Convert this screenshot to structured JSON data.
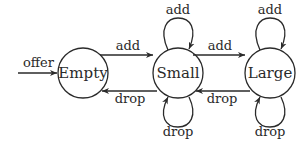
{
  "diagram": {
    "type": "state-machine",
    "states": [
      {
        "id": "empty",
        "label": "Empty"
      },
      {
        "id": "small",
        "label": "Small"
      },
      {
        "id": "large",
        "label": "Large"
      }
    ],
    "transitions": [
      {
        "from": "start",
        "to": "empty",
        "label": "offer"
      },
      {
        "from": "empty",
        "to": "small",
        "label": "add"
      },
      {
        "from": "small",
        "to": "empty",
        "label": "drop"
      },
      {
        "from": "small",
        "to": "small",
        "label": "add",
        "loop": "top"
      },
      {
        "from": "small",
        "to": "small",
        "label": "drop",
        "loop": "bottom"
      },
      {
        "from": "small",
        "to": "large",
        "label": "add"
      },
      {
        "from": "large",
        "to": "small",
        "label": "drop"
      },
      {
        "from": "large",
        "to": "large",
        "label": "add",
        "loop": "top"
      },
      {
        "from": "large",
        "to": "large",
        "label": "drop",
        "loop": "bottom"
      }
    ],
    "colors": {
      "ink": "#2a2a2a",
      "background": "#ffffff"
    }
  }
}
